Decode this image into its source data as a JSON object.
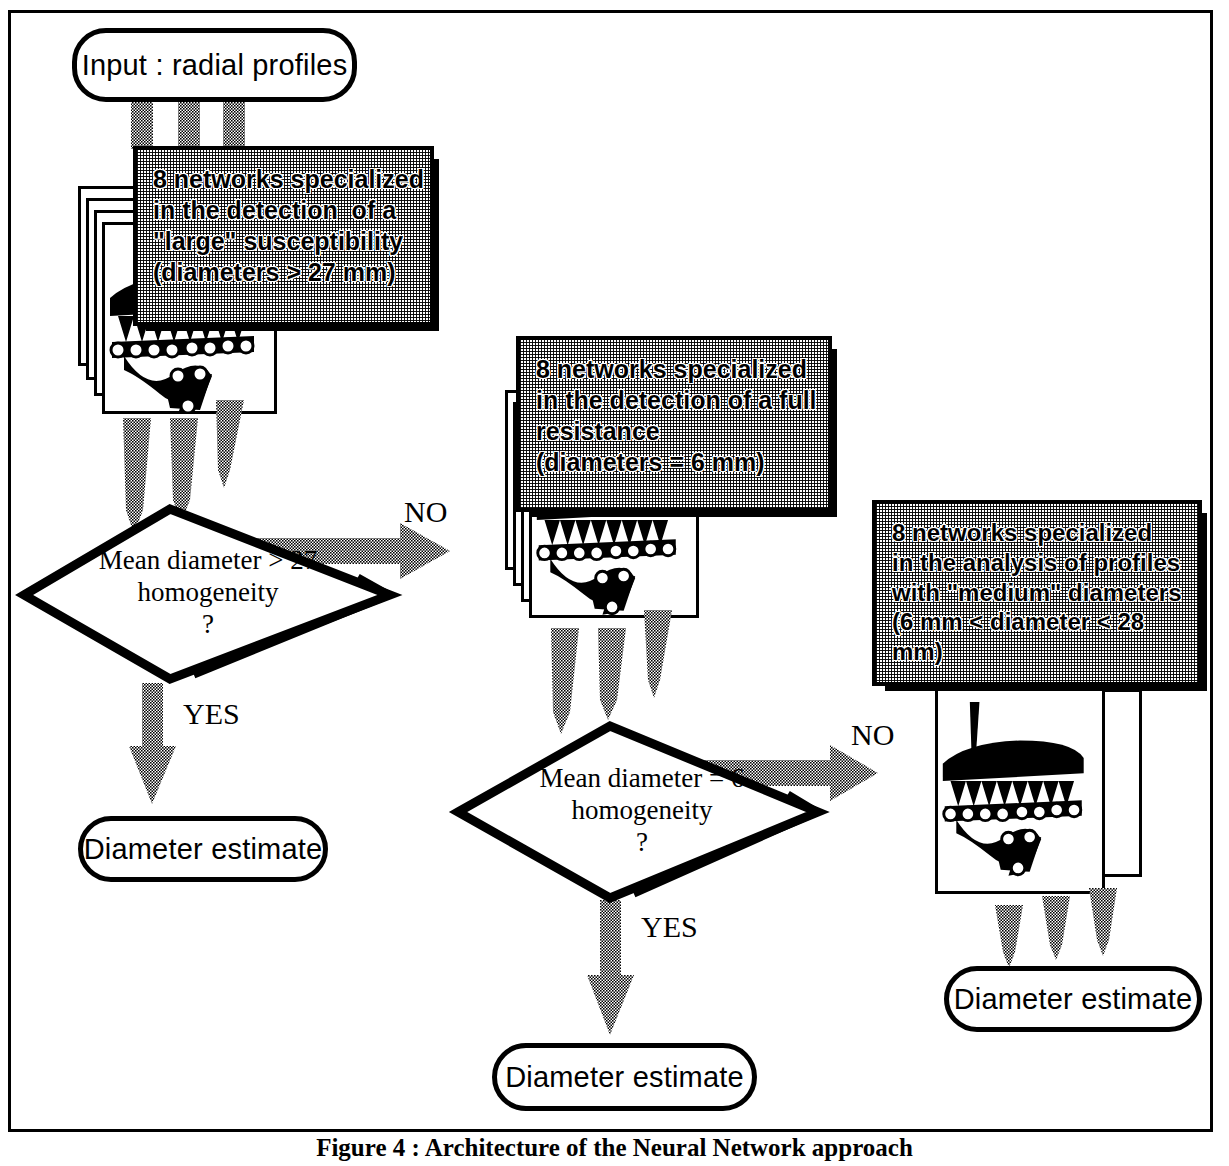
{
  "figure": {
    "caption": "Figure 4 : Architecture of the Neural Network approach",
    "input_label": "Input : radial profiles"
  },
  "nodes": {
    "input": {
      "label": "Input : radial profiles"
    },
    "network_box_1": {
      "lines": [
        "8 networks specialized",
        "in the detection  of a",
        "\"large\" susceptibility",
        "(diameters > 27 mm)"
      ]
    },
    "network_box_2": {
      "lines": [
        "8 networks specialized",
        "in the detection of a full",
        "resistance",
        "(diameters = 6 mm)"
      ]
    },
    "network_box_3": {
      "lines": [
        "8 networks specialized",
        "in the analysis of profiles",
        "with \"medium\" diameters",
        "(6 mm < diameter < 28",
        "mm)"
      ]
    },
    "decision_1": {
      "lines": [
        "Mean diameter > 27",
        "homogeneity",
        "?"
      ]
    },
    "decision_2": {
      "lines": [
        "Mean diameter  = 6",
        "homogeneity",
        "?"
      ]
    },
    "terminal_1": {
      "label": "Diameter estimate"
    },
    "terminal_2": {
      "label": "Diameter estimate"
    },
    "terminal_3": {
      "label": "Diameter estimate"
    }
  },
  "edges": {
    "decision_1_no": "NO",
    "decision_1_yes": "YES",
    "decision_2_no": "NO",
    "decision_2_yes": "YES"
  },
  "icons": {
    "neural_network": "neural-network-icon"
  },
  "colors": {
    "ink": "#000000",
    "paper": "#ffffff",
    "halftone_gray": "#9a9a9a"
  }
}
